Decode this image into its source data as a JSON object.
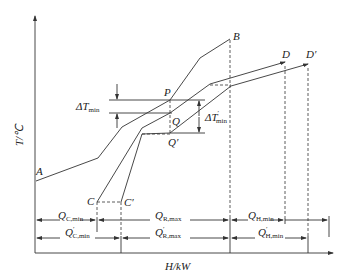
{
  "diagram": {
    "type": "composite-curves",
    "axes": {
      "y_label": "T/℃",
      "x_label": "H/kW"
    },
    "points": {
      "A": "A",
      "B": "B",
      "C": "C",
      "C_prime": "C′",
      "D": "D",
      "D_prime": "D′",
      "P": "P",
      "Q": "Q",
      "Q_prime": "Q′"
    },
    "annotations": {
      "dT_min": "ΔT",
      "dT_min_sub": "min",
      "dT_min_prime": "ΔT",
      "dT_min_prime_sub": "min",
      "dT_min_prime_sup": "′"
    },
    "dimensions": {
      "row1": {
        "Q_C_min": "Q",
        "Q_C_min_sub": "C,min",
        "Q_R_max": "Q",
        "Q_R_max_sub": "R,max",
        "Q_H_min": "Q",
        "Q_H_min_sub": "H,min"
      },
      "row2": {
        "Q_C_min_prime": "Q",
        "Q_C_min_prime_sub": "C,min",
        "Q_R_max_prime": "Q",
        "Q_R_max_prime_sub": "R,max",
        "Q_H_min_prime": "Q",
        "Q_H_min_prime_sub": "H,min",
        "prime": "′"
      }
    },
    "colors": {
      "line": "#333333",
      "background": "#ffffff"
    }
  }
}
